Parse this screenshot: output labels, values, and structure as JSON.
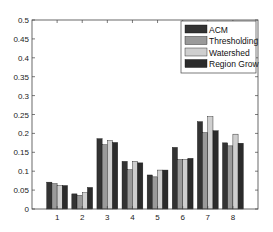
{
  "chart_data": {
    "type": "bar",
    "title": "",
    "xlabel": "",
    "ylabel": "",
    "categories": [
      "1",
      "2",
      "3",
      "4",
      "5",
      "6",
      "7",
      "8"
    ],
    "ylim": [
      0,
      0.5
    ],
    "yticks": [
      "0",
      "0.05",
      "0.1",
      "0.15",
      "0.2",
      "0.25",
      "0.3",
      "0.35",
      "0.4",
      "0.45",
      "0.5"
    ],
    "grid": false,
    "legend_position": "upper right",
    "series": [
      {
        "name": "ACM",
        "color": "#333333",
        "values": [
          0.071,
          0.04,
          0.186,
          0.126,
          0.09,
          0.163,
          0.231,
          0.175
        ]
      },
      {
        "name": "Thresholding",
        "color": "#9a9a9a",
        "values": [
          0.067,
          0.036,
          0.17,
          0.104,
          0.085,
          0.131,
          0.202,
          0.167
        ]
      },
      {
        "name": "Watershed",
        "color": "#cfcfcf",
        "values": [
          0.062,
          0.043,
          0.181,
          0.126,
          0.103,
          0.131,
          0.244,
          0.198
        ]
      },
      {
        "name": "Region Grow",
        "color": "#2b2b2b",
        "values": [
          0.062,
          0.057,
          0.176,
          0.122,
          0.103,
          0.134,
          0.207,
          0.174
        ]
      }
    ]
  }
}
